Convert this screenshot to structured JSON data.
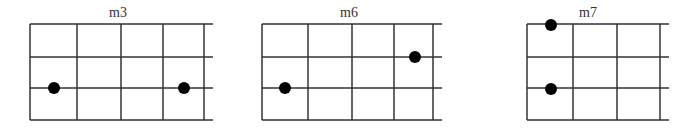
{
  "figure": {
    "background": "#ffffff",
    "line_color": "#333333",
    "dot_color": "#000000",
    "dot_radius": 6,
    "string_rows_y": [
      24,
      57,
      88,
      120
    ],
    "diagrams": [
      {
        "label": "m3",
        "label_x": 118,
        "fret_lines_x": [
          30,
          77,
          121,
          163,
          204
        ],
        "string_end_x": 213,
        "dots": [
          {
            "x": 54,
            "y": 88
          },
          {
            "x": 184,
            "y": 88
          }
        ]
      },
      {
        "label": "m6",
        "label_x": 349,
        "fret_lines_x": [
          262,
          308,
          352,
          394,
          433
        ],
        "string_end_x": 442,
        "dots": [
          {
            "x": 285,
            "y": 88
          },
          {
            "x": 415,
            "y": 57
          }
        ]
      },
      {
        "label": "m7",
        "label_x": 588,
        "fret_lines_x": [
          527,
          573,
          617,
          660
        ],
        "string_end_x": 669,
        "dots": [
          {
            "x": 551,
            "y": 25
          },
          {
            "x": 551,
            "y": 89
          }
        ]
      }
    ]
  }
}
